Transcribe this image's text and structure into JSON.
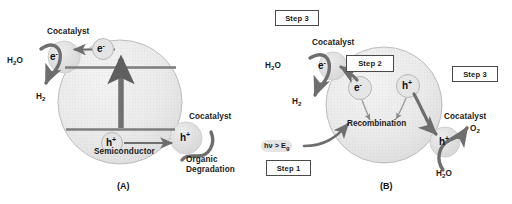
{
  "figure": {
    "type": "scientific-schematic",
    "background": "#ffffff",
    "colors": {
      "particle_fill": "#e9e9e9",
      "particle_stroke": "#b4b4b4",
      "cocatalyst_fill": "#e0e0e0",
      "band_line": "#7d7d7d",
      "arrow": "#6e6e6e",
      "thick_arrow": "#707070",
      "text": "#1b1b1b",
      "box_border": "#4a4a4a"
    }
  },
  "panel_a": {
    "tag": "(A)",
    "particle_label": "Semiconductor",
    "carriers": {
      "conduction_electron": "e",
      "conduction_electron_charge": "-",
      "valence_hole": "h",
      "valence_hole_charge": "+",
      "cocatalyst_electron": "e",
      "cocatalyst_electron_charge": "-",
      "cocatalyst_hole": "h",
      "cocatalyst_hole_charge": "+"
    },
    "cocatalyst_left_label": "Cocatalyst",
    "cocatalyst_right_label": "Cocatalyst",
    "reactant_left": "H",
    "reactant_left_sub": "2",
    "reactant_left_tail": "O",
    "product_left": "H",
    "product_left_sub": "2",
    "reaction_right_line1": "Organic",
    "reaction_right_line2": "Degradation"
  },
  "panel_b": {
    "tag": "(B)",
    "step_top": "Step 3",
    "step_middle": "Step 2",
    "step_right": "Step 3",
    "step_bottom": "Step 1",
    "photon_label_prefix": "h",
    "photon_label_nu": "ν",
    "photon_label_mid": " > E",
    "photon_label_sub": "g",
    "recombination_label": "Recombination",
    "cocatalyst_left_label": "Cocatalyst",
    "cocatalyst_right_label": "Cocatalyst",
    "carriers": {
      "cocatalyst_electron": "e",
      "cocatalyst_electron_charge": "-",
      "bulk_electron": "e",
      "bulk_electron_charge": "-",
      "bulk_hole": "h",
      "bulk_hole_charge": "+",
      "cocatalyst_hole": "h",
      "cocatalyst_hole_charge": "+"
    },
    "reactant_left": "H",
    "reactant_left_sub": "2",
    "reactant_left_tail": "O",
    "product_left": "H",
    "product_left_sub": "2",
    "product_right": "O",
    "product_right_sub": "2",
    "reactant_right": "H",
    "reactant_right_sub": "2",
    "reactant_right_tail": "O"
  }
}
